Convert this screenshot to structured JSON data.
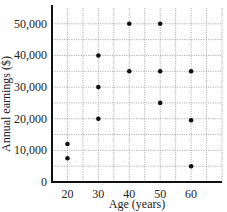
{
  "chart_data": {
    "type": "scatter",
    "title": "",
    "xlabel": "Age (years)",
    "ylabel": "Annual earnings ($)",
    "xlim": [
      15,
      70
    ],
    "ylim": [
      0,
      55000
    ],
    "x_ticks": [
      20,
      30,
      40,
      50,
      60
    ],
    "x_tick_labels": [
      "20",
      "30",
      "40",
      "50",
      "60"
    ],
    "y_ticks": [
      0,
      10000,
      20000,
      30000,
      40000,
      50000
    ],
    "y_tick_labels": [
      "0",
      "10,000",
      "20,000",
      "30,000",
      "40,000",
      "50,000"
    ],
    "grid": true,
    "grid_style": "dotted",
    "x_grid_step": 5,
    "y_grid_step": 5000,
    "legend": null,
    "series": [
      {
        "name": "Earnings",
        "color": "#111111",
        "points": [
          {
            "x": 20,
            "y": 12000
          },
          {
            "x": 20,
            "y": 7500
          },
          {
            "x": 30,
            "y": 40000
          },
          {
            "x": 30,
            "y": 30000
          },
          {
            "x": 30,
            "y": 20000
          },
          {
            "x": 40,
            "y": 50000
          },
          {
            "x": 40,
            "y": 35000
          },
          {
            "x": 50,
            "y": 50000
          },
          {
            "x": 50,
            "y": 35000
          },
          {
            "x": 50,
            "y": 25000
          },
          {
            "x": 60,
            "y": 35000
          },
          {
            "x": 60,
            "y": 19500
          },
          {
            "x": 60,
            "y": 5000
          }
        ]
      }
    ]
  },
  "colors": {
    "axis": "#111111",
    "grid": "#9a9a9a",
    "point": "#111111",
    "text": "#222222"
  }
}
